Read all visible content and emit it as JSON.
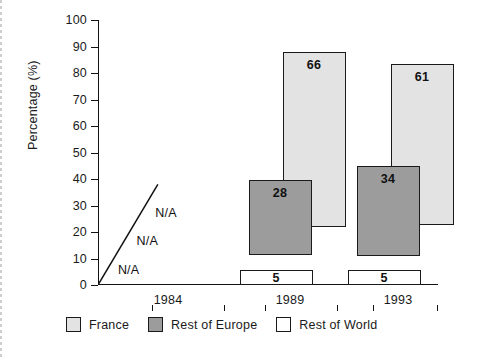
{
  "chart_data": {
    "type": "bar",
    "title": "",
    "subtitle": "",
    "xlabel": "",
    "ylabel": "Percentage (%)",
    "ylim": [
      0,
      100
    ],
    "ytick_step": 10,
    "yticks": [
      0,
      10,
      20,
      30,
      40,
      50,
      60,
      70,
      80,
      90,
      100
    ],
    "ytick_labels": [
      "0",
      "10",
      "20",
      "30",
      "40",
      "50",
      "60",
      "70",
      "80",
      "90",
      "100"
    ],
    "categories": [
      "1984",
      "1989",
      "1993"
    ],
    "grid": false,
    "legend_position": "bottom-left",
    "bar_style": "floating-offset-stacked",
    "series": [
      {
        "name": "France",
        "color": "#e3e3e3",
        "values": [
          null,
          66,
          61
        ],
        "value_labels": [
          "N/A",
          "66",
          "61"
        ],
        "bar_bottoms": [
          null,
          22,
          22.5
        ],
        "bar_tops": [
          null,
          88,
          83.5
        ]
      },
      {
        "name": "Rest of Europe",
        "color": "#9c9c9c",
        "values": [
          null,
          28,
          34
        ],
        "value_labels": [
          "N/A",
          "28",
          "34"
        ],
        "bar_bottoms": [
          null,
          11.5,
          11
        ],
        "bar_tops": [
          null,
          39.5,
          45
        ]
      },
      {
        "name": "Rest of World",
        "color": "#ffffff",
        "values": [
          null,
          5,
          5
        ],
        "value_labels": [
          "N/A",
          "5",
          "5"
        ],
        "bar_bottoms": [
          null,
          0,
          0
        ],
        "bar_tops": [
          null,
          5.5,
          5.5
        ]
      }
    ],
    "annotations": [
      {
        "text": "N/A",
        "x_pct": 20.0,
        "y_value": 27.0
      },
      {
        "text": "N/A",
        "x_pct": 14.5,
        "y_value": 16.5
      },
      {
        "text": "N/A",
        "x_pct": 9.0,
        "y_value": 5.5
      }
    ],
    "reference_line": {
      "type": "diagonal",
      "from": {
        "x_pct": 0,
        "y_value": 0
      },
      "to": {
        "x_pct": 17.6,
        "y_value": 38
      },
      "color": "#111111"
    }
  },
  "legend": {
    "items": [
      {
        "label": "France",
        "color": "#e3e3e3"
      },
      {
        "label": "Rest of Europe",
        "color": "#9c9c9c"
      },
      {
        "label": "Rest of World",
        "color": "#ffffff"
      }
    ]
  },
  "axis": {
    "y_title": "Percentage (%)"
  },
  "colors": {
    "france": "#e3e3e3",
    "rest_of_europe": "#9c9c9c",
    "rest_of_world": "#ffffff",
    "outline": "#1a1a1a",
    "background": "#ffffff"
  }
}
